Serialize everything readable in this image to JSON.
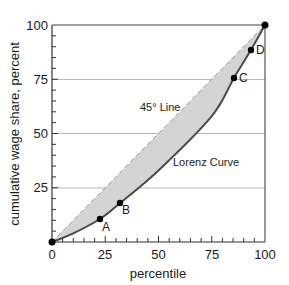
{
  "chart_data": {
    "type": "line",
    "title": "",
    "xlabel": "percentile",
    "ylabel": "cumulative wage share, percent",
    "xlim": [
      0,
      100
    ],
    "ylim": [
      0,
      100
    ],
    "x_ticks": [
      0,
      25,
      50,
      75,
      100
    ],
    "y_ticks": [
      25,
      50,
      75,
      100
    ],
    "x_tick_labels": [
      "0",
      "25",
      "50",
      "75",
      "100"
    ],
    "y_tick_labels": [
      "25",
      "50",
      "75",
      "100"
    ],
    "minor_tick_step": 5,
    "grid": "horizontal at 25, 50, 75",
    "series": [
      {
        "name": "45° Line",
        "style": "dashed",
        "x": [
          0,
          100
        ],
        "y": [
          0,
          100
        ]
      },
      {
        "name": "Lorenz Curve",
        "style": "solid",
        "x": [
          0,
          10,
          22.5,
          32,
          50,
          75,
          85.4,
          93.4,
          100
        ],
        "y": [
          0,
          4,
          10.6,
          18,
          33,
          58,
          75.6,
          88.5,
          100
        ]
      }
    ],
    "points": [
      {
        "label": "A",
        "x": 22.5,
        "y": 10.6
      },
      {
        "label": "B",
        "x": 32,
        "y": 18
      },
      {
        "label": "C",
        "x": 85.4,
        "y": 75.6
      },
      {
        "label": "D",
        "x": 93.4,
        "y": 88.5
      },
      {
        "label": "",
        "x": 0,
        "y": 0
      },
      {
        "label": "",
        "x": 100,
        "y": 100
      }
    ],
    "annotations": [
      {
        "text": "45° Line",
        "x": 45,
        "y": 62
      },
      {
        "text": "Lorenz Curve",
        "x": 57,
        "y": 37
      }
    ],
    "shaded_region": "area between 45° line and Lorenz curve"
  },
  "labels": {
    "xlabel": "percentile",
    "ylabel": "cumulative wage share, percent",
    "line45": "45° Line",
    "lorenz": "Lorenz Curve",
    "A": "A",
    "B": "B",
    "C": "C",
    "D": "D",
    "x0": "0",
    "x25": "25",
    "x50": "50",
    "x75": "75",
    "x100": "100",
    "y25": "25",
    "y50": "50",
    "y75": "75",
    "y100": "100"
  },
  "colors": {
    "shade": "#d4d4d4",
    "curve": "#4a4a4a",
    "dashed": "#9a9a9a",
    "grid": "#b8b8b8",
    "axis": "#333333",
    "point": "#000000"
  }
}
